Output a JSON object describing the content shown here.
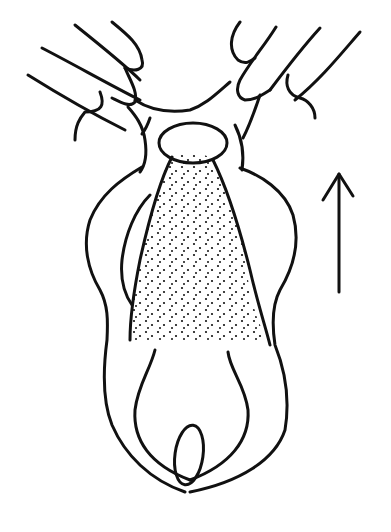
{
  "figure": {
    "type": "line-drawing illustration",
    "elements": {
      "hands": "two hands (left and right) retracting tissue at top",
      "oval_opening": "oval opening at top center",
      "stippled_region": "dotted tapered region in center",
      "inner_oval": "small oval near bottom center",
      "arrow": "upward arrow on right side"
    },
    "colors": {
      "line": "#111111",
      "background": "#ffffff"
    }
  },
  "caption": {
    "text": "",
    "visible": "partially cut off at bottom edge"
  }
}
